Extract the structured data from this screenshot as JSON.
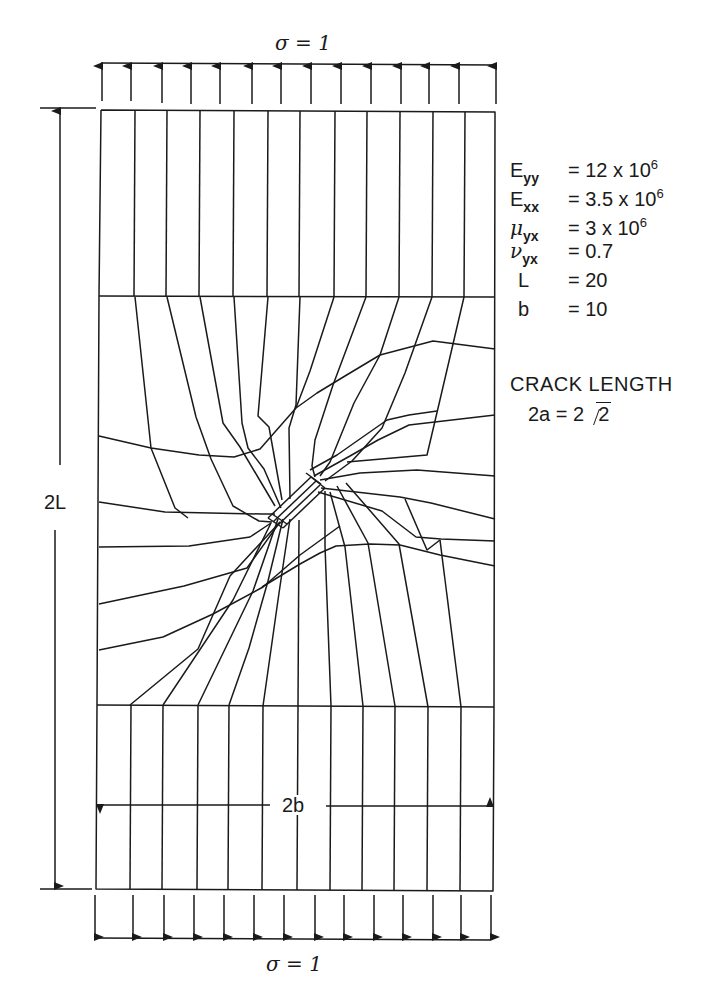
{
  "figure": {
    "top_load_label": "σ = 1",
    "bottom_load_label": "σ = 1",
    "height_dimension_label": "2L",
    "width_dimension_label": "2b",
    "crack_title": "CRACK LENGTH",
    "crack_equation_prefix": "2a = 2",
    "crack_equation_radicand": "2"
  },
  "properties": [
    {
      "symbol": "E",
      "subscript": "yy",
      "greek": false,
      "value": "= 12 x 10",
      "exponent": "6"
    },
    {
      "symbol": "E",
      "subscript": "xx",
      "greek": false,
      "value": "= 3.5 x 10",
      "exponent": "6"
    },
    {
      "symbol": "μ",
      "subscript": "yx",
      "greek": true,
      "value": "= 3 x 10",
      "exponent": "6"
    },
    {
      "symbol": "ν",
      "subscript": "yx",
      "greek": true,
      "value": "= 0.7",
      "exponent": ""
    },
    {
      "symbol": "L",
      "subscript": "",
      "greek": false,
      "value": "= 20",
      "exponent": ""
    },
    {
      "symbol": "b",
      "subscript": "",
      "greek": false,
      "value": "= 10",
      "exponent": ""
    }
  ],
  "colors": {
    "ink": "#1a1a1a",
    "paper": "#ffffff"
  }
}
